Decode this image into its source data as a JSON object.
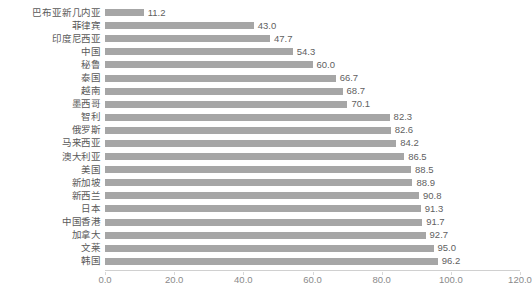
{
  "chart_data": {
    "type": "bar",
    "orientation": "horizontal",
    "title": "",
    "xlabel": "",
    "ylabel": "",
    "xlim": [
      0,
      120
    ],
    "xticks": [
      "0.0",
      "20.0",
      "40.0",
      "60.0",
      "80.0",
      "100.0",
      "120.0"
    ],
    "xtick_values": [
      0,
      20,
      40,
      60,
      80,
      100,
      120
    ],
    "grid": false,
    "legend": false,
    "bar_color": "#a6a6a6",
    "categories": [
      "巴布亚新几内亚",
      "菲律宾",
      "印度尼西亚",
      "中国",
      "秘鲁",
      "泰国",
      "越南",
      "墨西哥",
      "智利",
      "俄罗斯",
      "马来西亚",
      "澳大利亚",
      "美国",
      "新加坡",
      "新西兰",
      "日本",
      "中国香港",
      "加拿大",
      "文莱",
      "韩国"
    ],
    "values": [
      11.2,
      43.0,
      47.7,
      54.3,
      60.0,
      66.7,
      68.7,
      70.1,
      82.3,
      82.6,
      84.2,
      86.5,
      88.5,
      88.9,
      90.8,
      91.3,
      91.7,
      92.7,
      95.0,
      96.2
    ],
    "value_labels": [
      "11.2",
      "43.0",
      "47.7",
      "54.3",
      "60.0",
      "66.7",
      "68.7",
      "70.1",
      "82.3",
      "82.6",
      "84.2",
      "86.5",
      "88.5",
      "88.9",
      "90.8",
      "91.3",
      "91.7",
      "92.7",
      "95.0",
      "96.2"
    ]
  }
}
